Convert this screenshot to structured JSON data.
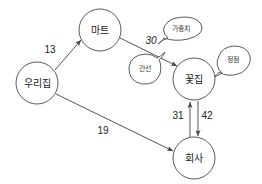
{
  "diagram": {
    "type": "directed-weighted-graph",
    "nodes": [
      {
        "id": "home",
        "label": "우리집",
        "cx": 37,
        "cy": 83,
        "r": 21
      },
      {
        "id": "mart",
        "label": "마트",
        "cx": 100,
        "cy": 30,
        "r": 21
      },
      {
        "id": "flower",
        "label": "꽃집",
        "cx": 194,
        "cy": 79,
        "r": 21
      },
      {
        "id": "company",
        "label": "회사",
        "cx": 194,
        "cy": 158,
        "r": 21
      }
    ],
    "edges": [
      {
        "from": "home",
        "to": "mart",
        "weight": "13",
        "label_x": 50,
        "label_y": 50,
        "slanted": false
      },
      {
        "from": "mart",
        "to": "flower",
        "weight": "30",
        "label_x": 151,
        "label_y": 41,
        "slanted": true
      },
      {
        "from": "home",
        "to": "company",
        "weight": "19",
        "label_x": 103,
        "label_y": 131,
        "slanted": false
      },
      {
        "from": "company",
        "to": "flower",
        "weight": "31",
        "label_x": 178,
        "label_y": 116,
        "slanted": false
      },
      {
        "from": "flower",
        "to": "company",
        "weight": "42",
        "label_x": 207,
        "label_y": 116,
        "slanted": false
      }
    ],
    "callouts": [
      {
        "id": "weight",
        "label": "가중치",
        "cx": 181,
        "cy": 30,
        "rx": 22,
        "ry": 13
      },
      {
        "id": "vertex",
        "label": "정점",
        "cx": 233,
        "cy": 61,
        "rx": 18,
        "ry": 14
      },
      {
        "id": "edge",
        "label": "간선",
        "cx": 145,
        "cy": 69,
        "rx": 17,
        "ry": 15
      }
    ],
    "colors": {
      "stroke": "#5a5a5a",
      "edge": "#555555",
      "text": "#1a1a1a",
      "background": "#ffffff"
    }
  }
}
